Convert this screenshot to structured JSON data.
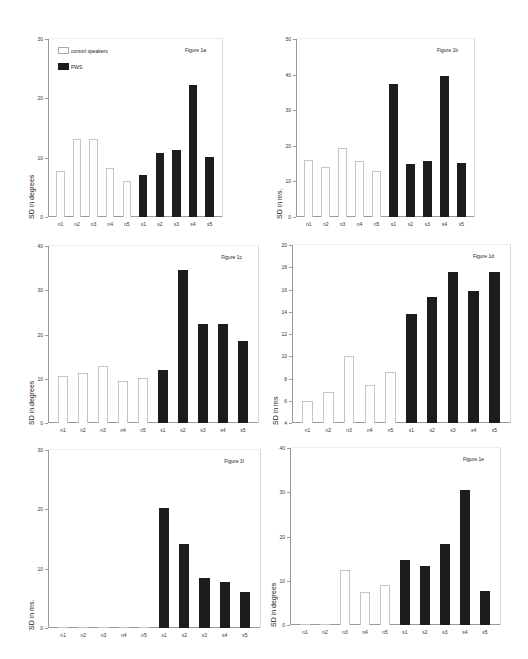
{
  "legend": {
    "control_label": "control speakers",
    "pws_label": "PWS",
    "control_color": "#ffffff",
    "pws_color": "#1c1c1c"
  },
  "chart_data": [
    {
      "id": "1a",
      "type": "bar",
      "title": "Figure 1a",
      "xlabel": "",
      "ylabel": "SD in degrees",
      "ylim": [
        0,
        30
      ],
      "yticks": [
        0,
        10,
        20,
        30
      ],
      "categories": [
        "n1",
        "n2",
        "n3",
        "n4",
        "n5",
        "s1",
        "s2",
        "s3",
        "s4",
        "s5"
      ],
      "series": [
        {
          "name": "control speakers",
          "values": [
            7.8,
            13.2,
            13.2,
            8.3,
            6.0,
            null,
            null,
            null,
            null,
            null
          ]
        },
        {
          "name": "PWS",
          "values": [
            null,
            null,
            null,
            null,
            null,
            7.0,
            10.8,
            11.3,
            22.3,
            10.1
          ]
        }
      ],
      "legend_position": "top-left",
      "grid": false
    },
    {
      "id": "1b",
      "type": "bar",
      "title": "Figure 1b",
      "xlabel": "",
      "ylabel": "SD in ms.",
      "ylim": [
        0,
        50
      ],
      "yticks": [
        0,
        10,
        20,
        30,
        40,
        50
      ],
      "categories": [
        "n1",
        "n2",
        "n3",
        "n4",
        "n5",
        "s1",
        "s2",
        "s3",
        "s4",
        "s5"
      ],
      "series": [
        {
          "name": "control speakers",
          "values": [
            16.0,
            14.0,
            19.5,
            15.7,
            13.0,
            null,
            null,
            null,
            null,
            null
          ]
        },
        {
          "name": "PWS",
          "values": [
            null,
            null,
            null,
            null,
            null,
            37.5,
            14.8,
            15.8,
            39.5,
            15.2
          ]
        }
      ],
      "grid": false
    },
    {
      "id": "1c",
      "type": "bar",
      "title": "Figure 1c",
      "xlabel": "",
      "ylabel": "SD in degrees",
      "ylim": [
        0,
        40
      ],
      "yticks": [
        0,
        10,
        20,
        30,
        40
      ],
      "categories": [
        "n1",
        "n2",
        "n3",
        "n4",
        "n5",
        "s1",
        "s2",
        "s3",
        "s4",
        "s5"
      ],
      "series": [
        {
          "name": "control speakers",
          "values": [
            10.6,
            11.3,
            12.9,
            9.6,
            10.2,
            null,
            null,
            null,
            null,
            null
          ]
        },
        {
          "name": "PWS",
          "values": [
            null,
            null,
            null,
            null,
            null,
            11.9,
            34.6,
            22.3,
            22.3,
            18.6
          ]
        }
      ],
      "grid": false
    },
    {
      "id": "1d",
      "type": "bar",
      "title": "Figure 1d",
      "xlabel": "",
      "ylabel": "SD in ms",
      "ylim": [
        4,
        20
      ],
      "yticks": [
        4,
        6,
        8,
        10,
        12,
        14,
        16,
        18,
        20
      ],
      "categories": [
        "n1",
        "n2",
        "n3",
        "n4",
        "n5",
        "s1",
        "s2",
        "s3",
        "s4",
        "s5"
      ],
      "series": [
        {
          "name": "control speakers",
          "values": [
            6.0,
            6.8,
            10.0,
            7.4,
            8.6,
            null,
            null,
            null,
            null,
            null
          ]
        },
        {
          "name": "PWS",
          "values": [
            null,
            null,
            null,
            null,
            null,
            13.8,
            15.3,
            17.6,
            15.9,
            17.6
          ]
        }
      ],
      "grid": false
    },
    {
      "id": "1f",
      "type": "bar",
      "title": "Figure 1f",
      "xlabel": "",
      "ylabel": "SD in ms.",
      "ylim": [
        0,
        30
      ],
      "yticks": [
        0,
        10,
        20,
        30
      ],
      "categories": [
        "n1",
        "n2",
        "n3",
        "n4",
        "n5",
        "s1",
        "s2",
        "s3",
        "s4",
        "s5"
      ],
      "series": [
        {
          "name": "control speakers",
          "values": [
            0,
            0,
            0,
            0,
            0,
            null,
            null,
            null,
            null,
            null
          ]
        },
        {
          "name": "PWS",
          "values": [
            null,
            null,
            null,
            null,
            null,
            20.2,
            14.1,
            8.5,
            7.8,
            6.1
          ]
        }
      ],
      "grid": false
    },
    {
      "id": "1e",
      "type": "bar",
      "title": "Figure 1e",
      "xlabel": "",
      "ylabel": "SD in degrees",
      "ylim": [
        0,
        40
      ],
      "yticks": [
        0,
        10,
        20,
        30,
        40
      ],
      "categories": [
        "n1",
        "n2",
        "n3",
        "n4",
        "n5",
        "s1",
        "s2",
        "s3",
        "s4",
        "s5"
      ],
      "series": [
        {
          "name": "control speakers",
          "values": [
            0,
            0,
            12.5,
            7.5,
            9.0,
            null,
            null,
            null,
            null,
            null
          ]
        },
        {
          "name": "PWS",
          "values": [
            null,
            null,
            null,
            null,
            null,
            14.8,
            13.3,
            18.2,
            30.5,
            7.6
          ]
        }
      ],
      "grid": false
    }
  ]
}
